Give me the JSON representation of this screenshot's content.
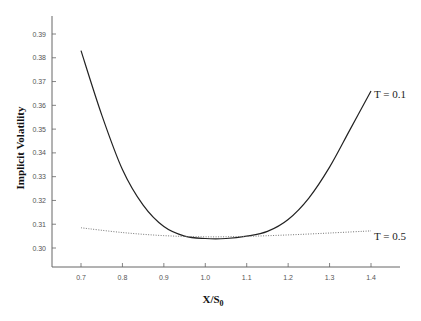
{
  "chart_data": {
    "type": "line",
    "title": "",
    "xlabel": "X/S",
    "xlabel_sub": "0",
    "ylabel": "Implicit Volatility",
    "xlim": [
      0.65,
      1.45
    ],
    "ylim": [
      0.295,
      0.395
    ],
    "x_ticks": [
      "0.7",
      "0.8",
      "0.9",
      "1.0",
      "1.1",
      "1.2",
      "1.3",
      "1.4"
    ],
    "y_ticks": [
      "0.30",
      "0.31",
      "0.32",
      "0.33",
      "0.34",
      "0.35",
      "0.36",
      "0.37",
      "0.38",
      "0.39"
    ],
    "grid": false,
    "series": [
      {
        "name": "T = 0.1",
        "style": "solid",
        "x": [
          0.7,
          0.75,
          0.8,
          0.85,
          0.9,
          0.95,
          1.0,
          1.05,
          1.1,
          1.15,
          1.2,
          1.25,
          1.3,
          1.35,
          1.4
        ],
        "y": [
          0.383,
          0.356,
          0.333,
          0.318,
          0.309,
          0.305,
          0.304,
          0.304,
          0.305,
          0.307,
          0.312,
          0.321,
          0.334,
          0.35,
          0.366
        ]
      },
      {
        "name": "T = 0.5",
        "style": "dotted",
        "x": [
          0.7,
          0.8,
          0.9,
          1.0,
          1.1,
          1.2,
          1.3,
          1.4
        ],
        "y": [
          0.3085,
          0.3065,
          0.3052,
          0.3047,
          0.3049,
          0.3055,
          0.3063,
          0.3072
        ]
      }
    ],
    "annotations": [
      "T = 0.1",
      "T = 0.5"
    ]
  }
}
